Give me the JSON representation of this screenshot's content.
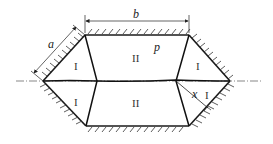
{
  "diagram": {
    "type": "slip-line field / hexagonal die cross-section",
    "labels": {
      "dim_a": "a",
      "dim_b": "b",
      "pressure": "p",
      "distance": "x"
    },
    "regions": [
      {
        "id": "upper-left",
        "label": "I"
      },
      {
        "id": "upper-center",
        "label": "II"
      },
      {
        "id": "upper-right",
        "label": "I"
      },
      {
        "id": "lower-left",
        "label": "I"
      },
      {
        "id": "lower-center",
        "label": "II"
      },
      {
        "id": "lower-right",
        "label": "I"
      }
    ],
    "colors": {
      "line": "#1a1a1a",
      "background": "#ffffff"
    }
  }
}
